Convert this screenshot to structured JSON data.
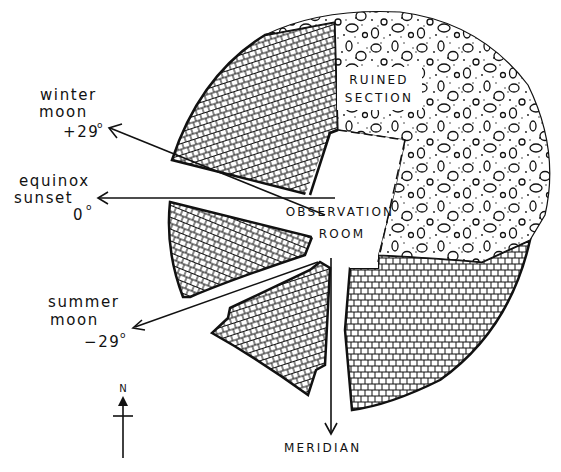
{
  "diagram": {
    "type": "archaeological plan of a circular tower with observation room and sight lines",
    "colors": {
      "ink": "#111111",
      "paper": "#ffffff"
    },
    "regions": {
      "ruined_section": {
        "label_line1": "RUINED",
        "label_line2": "SECTION",
        "texture": "rubble stones with stipple"
      },
      "observation_room": {
        "label_line1": "OBSERVATION",
        "label_line2": "ROOM"
      },
      "masonry": {
        "texture": "dressed stone masonry grid"
      }
    },
    "sightlines": [
      {
        "id": "winter-moon",
        "line1": "winter",
        "line2": "moon",
        "angle": "+29",
        "degree_symbol": "o"
      },
      {
        "id": "equinox-sunset",
        "line1": "equinox",
        "line2": "sunset",
        "angle": "0",
        "degree_symbol": "o"
      },
      {
        "id": "summer-moon",
        "line1": "summer",
        "line2": "moon",
        "angle": "−29",
        "degree_symbol": "o"
      },
      {
        "id": "meridian",
        "line1": "MERIDIAN"
      }
    ],
    "compass": {
      "label": "N"
    }
  }
}
